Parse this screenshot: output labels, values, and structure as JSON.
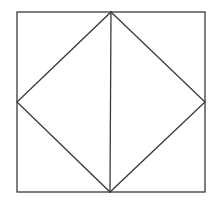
{
  "diagram": {
    "stroke_color": "#3a3a3a",
    "stroke_width": 1.3,
    "square": {
      "x1": 17,
      "y1": 12,
      "x2": 205,
      "y2": 192
    },
    "rhombus": {
      "top": [
        111,
        12
      ],
      "right": [
        205,
        102
      ],
      "bottom": [
        110,
        192
      ],
      "left": [
        17,
        102
      ]
    },
    "vertical_line": {
      "x1": 111,
      "y1": 12,
      "x2": 110,
      "y2": 192
    }
  }
}
